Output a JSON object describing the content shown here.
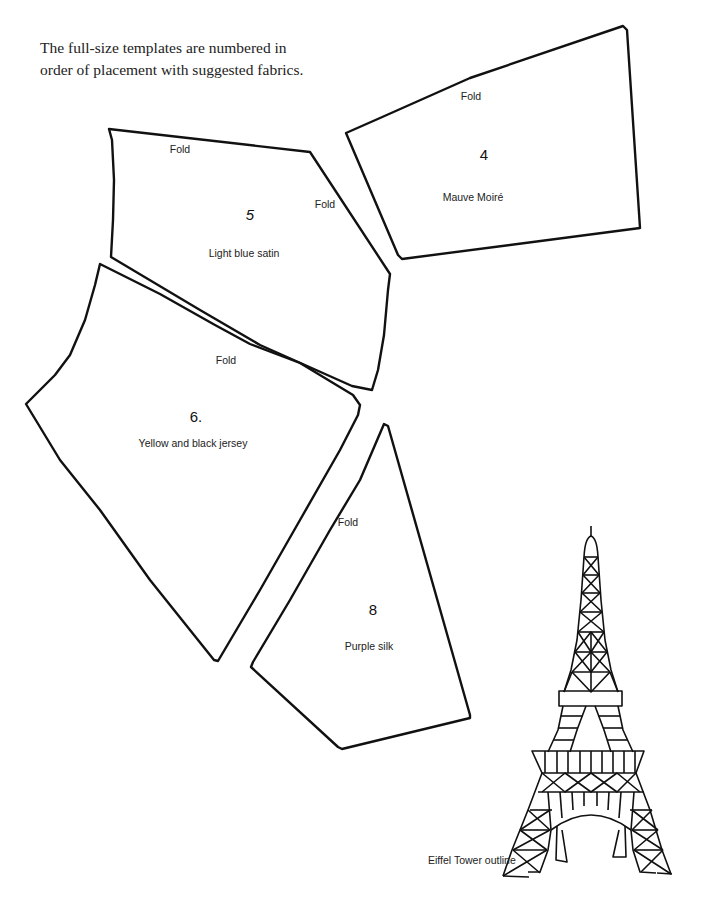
{
  "intro": {
    "line1": "The full-size templates are numbered in",
    "line2": "order of placement with suggested fabrics."
  },
  "templates": [
    {
      "id": "4",
      "number": "4",
      "fabric": "Mauve Moiré",
      "fold_labels": [
        "Fold"
      ],
      "points": "346,133 380,118 470,78 623,26 627,30 640,228 402,259 398,255"
    },
    {
      "id": "5",
      "number": "5",
      "fabric": "Light blue satin",
      "fold_labels": [
        "Fold",
        "Fold"
      ],
      "points": "109,129 310,152 390,274 388,290 384,335 378,370 372,390 352,386 260,345 200,310 111,257 113,220 114,180 112,140"
    },
    {
      "id": "6",
      "number": "6.",
      "fabric": "Yellow and black jersey",
      "fold_labels": [
        "Fold"
      ],
      "points": "100,264 104,266 160,294 215,325 250,344 300,363 353,395 360,405 358,415 340,450 300,520 260,590 218,661 214,660 150,580 100,510 60,460 26,404 30,400 55,375 70,355 85,320 95,285"
    },
    {
      "id": "8",
      "number": "8",
      "fabric": "Purple silk",
      "fold_labels": [
        "Fold"
      ],
      "points": "384,424 388,426 470,715 470,718 342,749 338,747 251,667 253,662 290,600 330,530 360,480"
    }
  ],
  "labels": {
    "t4_fold": "Fold",
    "t4_number": "4",
    "t4_fabric": "Mauve Moiré",
    "t5_fold_top": "Fold",
    "t5_fold_side": "Fold",
    "t5_number": "5",
    "t5_fabric": "Light blue satin",
    "t6_fold": "Fold",
    "t6_number": "6.",
    "t6_fabric": "Yellow and black jersey",
    "t8_fold": "Fold",
    "t8_number": "8",
    "t8_fabric": "Purple silk"
  },
  "eiffel": {
    "caption": "Eiffel Tower outline"
  },
  "colors": {
    "ink": "#111111",
    "paper": "#ffffff"
  }
}
